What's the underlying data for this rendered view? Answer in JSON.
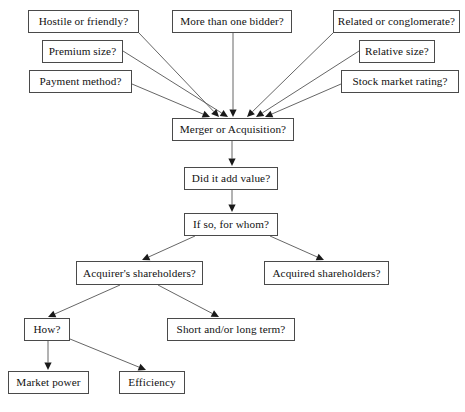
{
  "diagram": {
    "type": "flowchart",
    "background_color": "#ffffff",
    "box_border_color": "#4a4a4a",
    "line_color": "#555555",
    "arrowhead_color": "#1a1a1a",
    "text_color": "#111111",
    "nodes": [
      {
        "id": "hostile",
        "label": "Hostile or friendly?",
        "x": 28,
        "y": 10,
        "w": 111,
        "h": 23
      },
      {
        "id": "bidder",
        "label": "More than one bidder?",
        "x": 172,
        "y": 10,
        "w": 120,
        "h": 23
      },
      {
        "id": "related",
        "label": "Related or conglomerate?",
        "x": 333,
        "y": 10,
        "w": 127,
        "h": 23
      },
      {
        "id": "premium",
        "label": "Premium size?",
        "x": 42,
        "y": 40,
        "w": 81,
        "h": 23
      },
      {
        "id": "relative",
        "label": "Relative size?",
        "x": 359,
        "y": 40,
        "w": 76,
        "h": 23
      },
      {
        "id": "payment",
        "label": "Payment method?",
        "x": 29,
        "y": 70,
        "w": 103,
        "h": 23
      },
      {
        "id": "stock",
        "label": "Stock market rating?",
        "x": 341,
        "y": 70,
        "w": 118,
        "h": 23
      },
      {
        "id": "merger",
        "label": "Merger or Acquisition?",
        "x": 172,
        "y": 118,
        "w": 122,
        "h": 23
      },
      {
        "id": "addvalue",
        "label": "Did it add value?",
        "x": 184,
        "y": 167,
        "w": 94,
        "h": 23
      },
      {
        "id": "forwhom",
        "label": "If so, for whom?",
        "x": 184,
        "y": 213,
        "w": 94,
        "h": 23
      },
      {
        "id": "acquirer",
        "label": "Acquirer's shareholders?",
        "x": 76,
        "y": 261,
        "w": 127,
        "h": 24
      },
      {
        "id": "acquired",
        "label": "Acquired shareholders?",
        "x": 264,
        "y": 261,
        "w": 125,
        "h": 24
      },
      {
        "id": "how",
        "label": "How?",
        "x": 24,
        "y": 318,
        "w": 46,
        "h": 23
      },
      {
        "id": "shortlong",
        "label": "Short and/or long term?",
        "x": 167,
        "y": 318,
        "w": 128,
        "h": 23
      },
      {
        "id": "marketpower",
        "label": "Market power",
        "x": 8,
        "y": 371,
        "w": 81,
        "h": 23
      },
      {
        "id": "efficiency",
        "label": "Efficiency",
        "x": 119,
        "y": 371,
        "w": 66,
        "h": 23
      }
    ],
    "edges": [
      {
        "from": "hostile",
        "to": "merger",
        "x1": 139,
        "y1": 33,
        "x2": 219,
        "y2": 117,
        "arrow": true
      },
      {
        "from": "premium",
        "to": "merger",
        "x1": 123,
        "y1": 51,
        "x2": 228,
        "y2": 117,
        "arrow": true
      },
      {
        "from": "payment",
        "to": "merger",
        "x1": 132,
        "y1": 84,
        "x2": 210,
        "y2": 117,
        "arrow": true
      },
      {
        "from": "bidder",
        "to": "merger",
        "x1": 233,
        "y1": 33,
        "x2": 233,
        "y2": 117,
        "arrow": true
      },
      {
        "from": "related",
        "to": "merger",
        "x1": 333,
        "y1": 33,
        "x2": 247,
        "y2": 117,
        "arrow": true
      },
      {
        "from": "relative",
        "to": "merger",
        "x1": 359,
        "y1": 51,
        "x2": 256,
        "y2": 117,
        "arrow": true
      },
      {
        "from": "stock",
        "to": "merger",
        "x1": 341,
        "y1": 84,
        "x2": 265,
        "y2": 117,
        "arrow": true
      },
      {
        "from": "merger",
        "to": "addvalue",
        "x1": 232,
        "y1": 141,
        "x2": 232,
        "y2": 166,
        "arrow": true
      },
      {
        "from": "addvalue",
        "to": "forwhom",
        "x1": 232,
        "y1": 190,
        "x2": 232,
        "y2": 212,
        "arrow": true
      },
      {
        "from": "forwhom",
        "to": "acquirer",
        "x1": 195,
        "y1": 236,
        "x2": 142,
        "y2": 260,
        "arrow": true
      },
      {
        "from": "forwhom",
        "to": "acquired",
        "x1": 270,
        "y1": 236,
        "x2": 324,
        "y2": 260,
        "arrow": true
      },
      {
        "from": "acquirer",
        "to": "how",
        "x1": 120,
        "y1": 285,
        "x2": 48,
        "y2": 317,
        "arrow": true
      },
      {
        "from": "acquirer",
        "to": "shortlong",
        "x1": 158,
        "y1": 285,
        "x2": 219,
        "y2": 317,
        "arrow": true
      },
      {
        "from": "how",
        "to": "marketpower",
        "x1": 48,
        "y1": 341,
        "x2": 48,
        "y2": 370,
        "arrow": true
      },
      {
        "from": "how",
        "to": "efficiency",
        "x1": 70,
        "y1": 339,
        "x2": 146,
        "y2": 370,
        "arrow": true
      }
    ]
  }
}
